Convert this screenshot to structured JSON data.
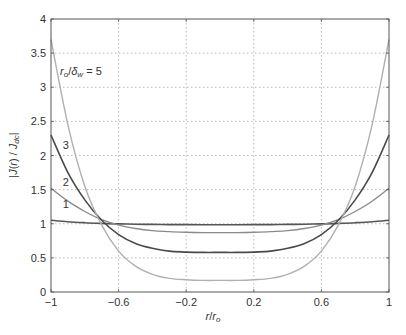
{
  "chart_data": {
    "type": "line",
    "title": "",
    "xlabel": "r/r_o",
    "ylabel": "|J(r)/J_dc|",
    "xlim": [
      -1,
      1
    ],
    "ylim": [
      0,
      4
    ],
    "xticks": [
      -1,
      -0.6,
      -0.2,
      0.2,
      0.6,
      1
    ],
    "xtick_labels": [
      "−1",
      "−0.6",
      "−0.2",
      "0.2",
      "0.6",
      "1"
    ],
    "yticks": [
      0,
      0.5,
      1,
      1.5,
      2,
      2.5,
      3,
      3.5,
      4
    ],
    "ytick_labels": [
      "0",
      "0.5",
      "1",
      "1.5",
      "2",
      "2.5",
      "3",
      "3.5",
      "4"
    ],
    "grid": true,
    "annotation": "r_o/δ_w = 5",
    "x": [
      -1,
      -0.9,
      -0.8,
      -0.7,
      -0.6,
      -0.5,
      -0.4,
      -0.3,
      -0.2,
      -0.1,
      0,
      0.1,
      0.2,
      0.3,
      0.4,
      0.5,
      0.6,
      0.7,
      0.8,
      0.9,
      1
    ],
    "series": [
      {
        "name": "1",
        "color": "#555555",
        "width": 1.6,
        "values": [
          1.05,
          1.03,
          1.015,
          1.005,
          0.998,
          0.993,
          0.99,
          0.988,
          0.987,
          0.986,
          0.986,
          0.986,
          0.987,
          0.988,
          0.99,
          0.993,
          0.998,
          1.005,
          1.015,
          1.03,
          1.05
        ]
      },
      {
        "name": "2",
        "color": "#8a8a8a",
        "width": 1.4,
        "values": [
          1.52,
          1.33,
          1.18,
          1.06,
          0.98,
          0.93,
          0.9,
          0.885,
          0.875,
          0.87,
          0.87,
          0.87,
          0.875,
          0.885,
          0.9,
          0.93,
          0.98,
          1.06,
          1.18,
          1.33,
          1.52
        ]
      },
      {
        "name": "3",
        "color": "#4a4a4a",
        "width": 1.6,
        "values": [
          2.3,
          1.75,
          1.35,
          1.05,
          0.84,
          0.71,
          0.64,
          0.6,
          0.585,
          0.58,
          0.58,
          0.58,
          0.585,
          0.6,
          0.64,
          0.71,
          0.84,
          1.05,
          1.35,
          1.75,
          2.3
        ]
      },
      {
        "name": "5",
        "color": "#b0b0b0",
        "width": 1.4,
        "values": [
          3.7,
          2.45,
          1.55,
          0.98,
          0.6,
          0.38,
          0.26,
          0.2,
          0.18,
          0.17,
          0.17,
          0.17,
          0.18,
          0.2,
          0.26,
          0.38,
          0.6,
          0.98,
          1.55,
          2.45,
          3.7
        ]
      }
    ],
    "curve_labels": [
      {
        "text": "1",
        "x": -0.93,
        "y": 1.23
      },
      {
        "text": "2",
        "x": -0.93,
        "y": 1.56
      },
      {
        "text": "3",
        "x": -0.93,
        "y": 2.1
      }
    ]
  }
}
